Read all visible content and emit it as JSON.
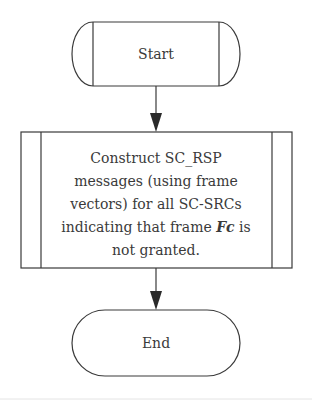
{
  "diagram": {
    "type": "flowchart",
    "nodes": [
      {
        "id": "start",
        "shape": "terminator-predefined",
        "label": "Start"
      },
      {
        "id": "process",
        "shape": "predefined-process",
        "lines": [
          "Construct SC_RSP",
          "messages (using frame",
          "vectors) for all SC-SRCs",
          "indicating that frame ",
          "not granted."
        ],
        "emphasis": "Fc",
        "emphasis_suffix": " is"
      },
      {
        "id": "end",
        "shape": "terminator",
        "label": "End"
      }
    ],
    "edges": [
      {
        "from": "start",
        "to": "process"
      },
      {
        "from": "process",
        "to": "end"
      }
    ],
    "colors": {
      "stroke": "#3a3a3a",
      "background": "#ffffff"
    }
  }
}
